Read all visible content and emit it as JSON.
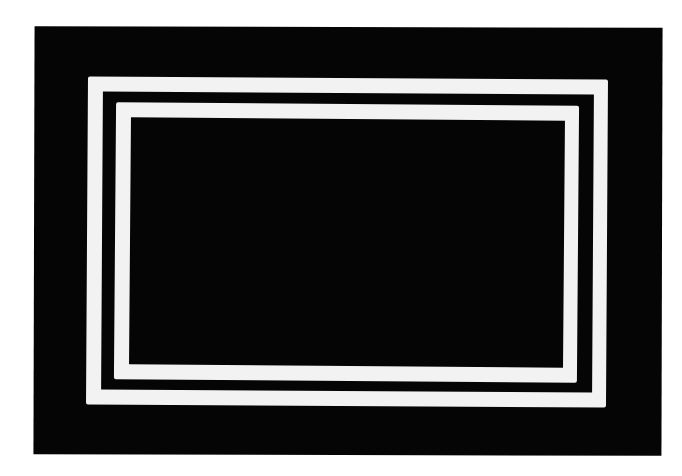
{
  "image": {
    "description": "Black rectangle with two nested white rectangular outline bands",
    "colors": {
      "background": "#ffffff",
      "field": "#050505",
      "bands": "#f2f2f2"
    },
    "bands": [
      {
        "name": "outer",
        "count": 1
      },
      {
        "name": "inner",
        "count": 1
      }
    ]
  }
}
